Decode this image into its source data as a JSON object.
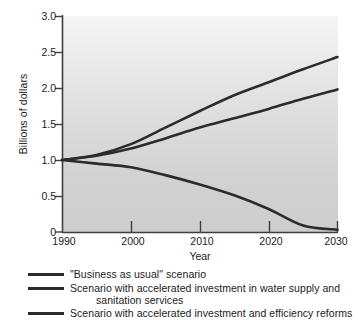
{
  "chart_data": {
    "type": "line",
    "title": "",
    "xlabel": "Year",
    "ylabel": "Billions of dollars",
    "xlim": [
      1990,
      2030
    ],
    "ylim": [
      0,
      3.0
    ],
    "grid": false,
    "legend_position": "below",
    "x_ticks": [
      "1990",
      "2000",
      "2010",
      "2020",
      "2030"
    ],
    "x_tick_values": [
      1990,
      2000,
      2010,
      2020,
      2030
    ],
    "y_ticks": [
      "3.0",
      "2.5",
      "2.0",
      "1.5",
      "1.0",
      "0.5",
      "0"
    ],
    "y_tick_values": [
      3.0,
      2.5,
      2.0,
      1.5,
      1.0,
      0.5,
      0
    ],
    "x": [
      1990,
      1995,
      2000,
      2005,
      2010,
      2015,
      2020,
      2025,
      2030
    ],
    "series": [
      {
        "name": "\"Business as usual\" scenario",
        "color": "#2b2b2b",
        "values": [
          1.0,
          1.07,
          1.22,
          1.45,
          1.68,
          1.9,
          2.08,
          2.26,
          2.43
        ]
      },
      {
        "name": "Scenario with accelerated investment in water supply and sanitation services",
        "color": "#2b2b2b",
        "values": [
          1.0,
          1.06,
          1.16,
          1.3,
          1.45,
          1.58,
          1.71,
          1.85,
          1.98
        ]
      },
      {
        "name": "Scenario with accelerated investment and efficiency reforms",
        "color": "#2b2b2b",
        "values": [
          1.0,
          0.95,
          0.9,
          0.79,
          0.66,
          0.51,
          0.32,
          0.09,
          0.03
        ]
      }
    ]
  },
  "axes": {
    "y_title": "Billions of dollars",
    "x_title": "Year",
    "y_tick_labels": [
      "3.0",
      "2.5",
      "2.0",
      "1.5",
      "1.0",
      "0.5",
      "0"
    ],
    "x_tick_labels": [
      "1990",
      "2000",
      "2010",
      "2020",
      "2030"
    ]
  },
  "legend": {
    "items": [
      {
        "label": "\"Business as usual\" scenario",
        "label_line2": ""
      },
      {
        "label": "Scenario with accelerated investment in water supply and",
        "label_line2": "sanitation services"
      },
      {
        "label": "Scenario with accelerated investment and efficiency reforms",
        "label_line2": ""
      }
    ]
  },
  "colors": {
    "line": "#2b2b2b",
    "axis": "#4a4a4a",
    "plot_bg_top": "#f4f4f4",
    "plot_bg_bottom": "#cfcfcf",
    "text": "#1b1b1b"
  }
}
